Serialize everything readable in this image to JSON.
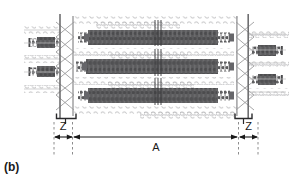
{
  "figure": {
    "panel_label": "(b)",
    "type": "schematic-diagram",
    "colors": {
      "fiber_dark": "#58585a",
      "linker_light": "#b9b9bb",
      "scaffold_line": "#8a8a8c",
      "annotation": "#1a1a1a",
      "background": "#ffffff"
    },
    "dimensions": {
      "width": 303,
      "height": 184
    }
  },
  "annotations": {
    "span_A": {
      "label": "A",
      "kind": "double-arrow-dimension",
      "x_start": 73,
      "x_end": 238,
      "y": 137
    },
    "span_Z_left": {
      "label": "Z",
      "kind": "double-arrow-dimension",
      "x_start": 54,
      "x_end": 72,
      "y": 137
    },
    "span_Z_right": {
      "label": "Z",
      "kind": "double-arrow-dimension",
      "x_start": 239,
      "x_end": 258,
      "y": 137
    }
  },
  "structure": {
    "boundary_left_x": 60,
    "boundary_right_x": 248,
    "fiber_rows": [
      {
        "name": "fiber-row-1",
        "y": 37
      },
      {
        "name": "fiber-row-2",
        "y": 66
      },
      {
        "name": "fiber-row-3",
        "y": 95
      }
    ],
    "linker_rows": [
      {
        "name": "linker-row-top",
        "y": 22
      },
      {
        "name": "linker-row-1",
        "y": 52
      },
      {
        "name": "linker-row-2",
        "y": 81
      },
      {
        "name": "linker-row-bottom",
        "y": 110
      }
    ],
    "external_fibers_left": [
      {
        "name": "external-fiber-left-1",
        "y": 43
      },
      {
        "name": "external-fiber-left-2",
        "y": 73
      }
    ],
    "external_fibers_right": [
      {
        "name": "external-fiber-right-1",
        "y": 57
      },
      {
        "name": "external-fiber-right-2",
        "y": 87
      }
    ],
    "center_ticks": {
      "name": "center-tick-marks",
      "x": 158,
      "count": 3
    }
  }
}
